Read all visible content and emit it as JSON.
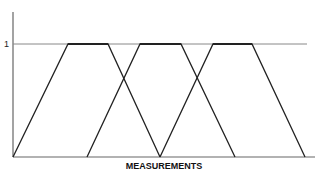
{
  "diagram": {
    "type": "fuzzy membership functions (trapezoidal)",
    "y_tick_label": "1",
    "x_axis_label": "MEASUREMENTS",
    "colors": {
      "axis": "#666666",
      "reference_line": "#888888",
      "shape_line": "#222222",
      "background": "#ffffff"
    },
    "axes": {
      "origin": [
        13,
        157
      ],
      "y_top": 12,
      "x_end": 315,
      "one_level_y": 44,
      "one_line_end_x": 307
    },
    "trapezoids": [
      {
        "name": "set-1",
        "points": [
          [
            13,
            157
          ],
          [
            68,
            44
          ],
          [
            108,
            44
          ],
          [
            160,
            157
          ]
        ]
      },
      {
        "name": "set-2",
        "points": [
          [
            87,
            157
          ],
          [
            140,
            44
          ],
          [
            181,
            44
          ],
          [
            235,
            157
          ]
        ]
      },
      {
        "name": "set-3",
        "points": [
          [
            160,
            157
          ],
          [
            213,
            44
          ],
          [
            252,
            44
          ],
          [
            305,
            157
          ]
        ]
      }
    ]
  }
}
